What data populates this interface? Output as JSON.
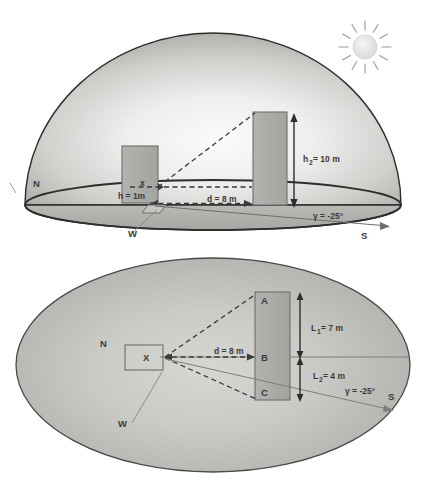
{
  "figure": {
    "colors": {
      "dome_fill_light": "#f2f2f0",
      "dome_fill_mid": "#c9c9c6",
      "dome_fill_dark": "#a9a9a6",
      "ground_fill": "#b4b4b1",
      "building_fill": "#aaaaa7",
      "building_stroke": "#6e6e6e",
      "outline": "#2d2d2d",
      "text": "#3a3a3a",
      "sun_fill": "#e8e8e8",
      "dashed": "#3a3a3a"
    }
  },
  "upper_panel": {
    "name": "sky-dome-elevation-view",
    "compass": {
      "north": "N",
      "west": "W",
      "south": "S"
    },
    "observer_label": "x",
    "observer_height_label": "h = 1m",
    "distance_label": "d = 8 m",
    "obstruction_height_label": "h",
    "obstruction_height_sub": "2",
    "obstruction_height_value": "= 10 m",
    "obstruction_height_full": "h₂ = 10 m",
    "azimuth_label": "γ = -25°",
    "sun": {
      "name": "sun-icon",
      "rays": 12
    }
  },
  "lower_panel": {
    "name": "horizontal-plan-view",
    "compass": {
      "north": "N",
      "west": "W",
      "south": "S"
    },
    "observer_label": "X",
    "distance_label": "d = 8 m",
    "points": [
      "A",
      "B",
      "C"
    ],
    "length_1_label": "L",
    "length_1_sub": "1",
    "length_1_value": "= 7 m",
    "length_1_full": "L₁ = 7 m",
    "length_2_label": "L",
    "length_2_sub": "2",
    "length_2_value": "= 4 m",
    "length_2_full": "L₂ = 4 m",
    "azimuth_label": "γ = -25°"
  },
  "measurements": {
    "observer_height_m": 1,
    "obstruction_height_m": 10,
    "distance_m": 8,
    "length_1_m": 7,
    "length_2_m": 4,
    "azimuth_deg": -25
  }
}
